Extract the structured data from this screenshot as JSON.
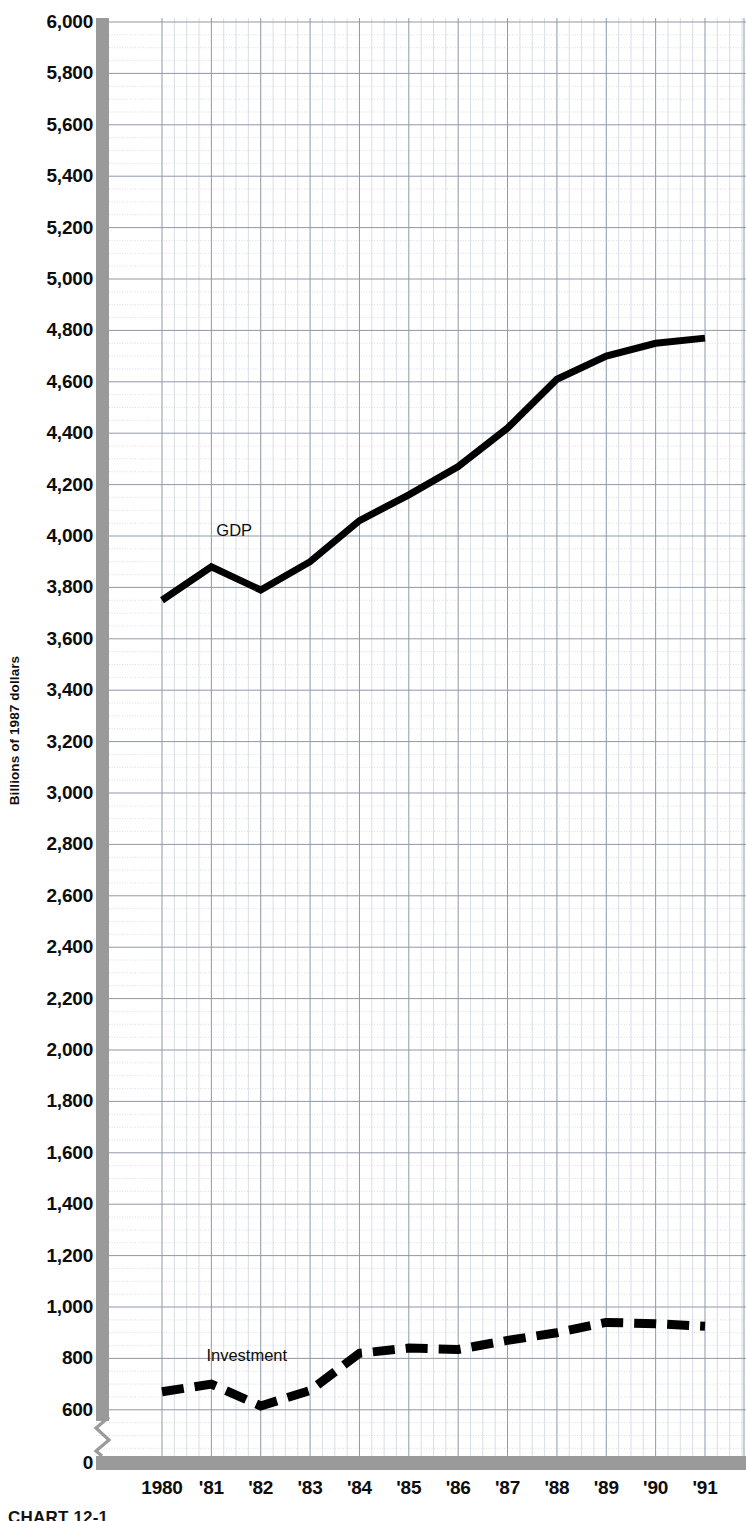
{
  "caption": "CHART 12-1",
  "chart_data": {
    "type": "line",
    "title": "",
    "subtitle": "",
    "xlabel": "",
    "ylabel": "Billions of 1987 dollars",
    "grid": true,
    "legend_position": "inline-annotation",
    "axis_break": true,
    "axis_break_note": "y-axis broken between 0 and ~500",
    "xlim": [
      1980,
      1991
    ],
    "ylim": [
      0,
      6000
    ],
    "ytick_step": 200,
    "minor_gridlines_per_year": 4,
    "x": [
      1980,
      1981,
      1982,
      1983,
      1984,
      1985,
      1986,
      1987,
      1988,
      1989,
      1990,
      1991
    ],
    "categories": [
      "1980",
      "'81",
      "'82",
      "'83",
      "'84",
      "'85",
      "'86",
      "'87",
      "'88",
      "'89",
      "'90",
      "'91"
    ],
    "ytick_labels": [
      "6,000",
      "5,800",
      "5,600",
      "5,400",
      "5,200",
      "5,000",
      "4,800",
      "4,600",
      "4,400",
      "4,200",
      "4,000",
      "3,800",
      "3,600",
      "3,400",
      "3,200",
      "3,000",
      "2,800",
      "2,600",
      "2,400",
      "2,200",
      "2,000",
      "1,800",
      "1,600",
      "1,400",
      "1,200",
      "1,000",
      "800",
      "600",
      "0"
    ],
    "ytick_values": [
      6000,
      5800,
      5600,
      5400,
      5200,
      5000,
      4800,
      4600,
      4400,
      4200,
      4000,
      3800,
      3600,
      3400,
      3200,
      3000,
      2800,
      2600,
      2400,
      2200,
      2000,
      1800,
      1600,
      1400,
      1200,
      1000,
      800,
      600,
      0
    ],
    "series": [
      {
        "name": "GDP",
        "label": "GDP",
        "style": "solid",
        "color": "#000000",
        "width": 7,
        "label_x": 1981.1,
        "label_y": 4020,
        "values": [
          3750,
          3880,
          3790,
          3900,
          4060,
          4160,
          4270,
          4420,
          4610,
          4700,
          4750,
          4770
        ]
      },
      {
        "name": "Investment",
        "label": "Investment",
        "style": "dashed",
        "color": "#000000",
        "width": 9,
        "label_x": 1980.9,
        "label_y": 810,
        "values": [
          670,
          700,
          615,
          675,
          820,
          840,
          835,
          870,
          900,
          940,
          935,
          925
        ]
      }
    ]
  },
  "colors": {
    "axis_bar": "#9a9a9a",
    "major_grid": "#8f98a8",
    "minor_grid": "#c8cfdb",
    "line": "#000000",
    "background": "#ffffff"
  }
}
